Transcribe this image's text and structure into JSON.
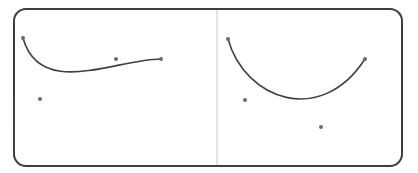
{
  "figure": {
    "width": 418,
    "height": 173,
    "background": "#ffffff",
    "frame": {
      "x": 14,
      "y": 9,
      "width": 388,
      "height": 157,
      "radius": 12,
      "stroke": "#3f3f3f",
      "stroke_width": 2
    },
    "divider": {
      "x": 217,
      "y1": 10,
      "y2": 165,
      "stroke": "#c8c8c8",
      "stroke_width": 1
    },
    "curve_color": "#404040",
    "point_color": "#6a6a6a",
    "panels": [
      {
        "name": "left-panel",
        "curve": {
          "type": "cubic-bezier",
          "start": [
            23,
            38
          ],
          "control1": [
            40,
            99
          ],
          "control2": [
            116,
            59
          ],
          "end": [
            161,
            59
          ]
        },
        "points": [
          {
            "name": "start-point",
            "x": 23,
            "y": 38
          },
          {
            "name": "end-point",
            "x": 161,
            "y": 59
          },
          {
            "name": "control-point-1",
            "x": 40,
            "y": 99
          },
          {
            "name": "control-point-2",
            "x": 116,
            "y": 59
          }
        ]
      },
      {
        "name": "right-panel",
        "curve": {
          "type": "cubic-bezier",
          "start": [
            228,
            39
          ],
          "control1": [
            245,
            100
          ],
          "control2": [
            321,
            127
          ],
          "end": [
            365,
            59
          ]
        },
        "points": [
          {
            "name": "start-point",
            "x": 228,
            "y": 39
          },
          {
            "name": "end-point",
            "x": 365,
            "y": 59
          },
          {
            "name": "control-point-1",
            "x": 245,
            "y": 100
          },
          {
            "name": "control-point-2",
            "x": 321,
            "y": 127
          }
        ]
      }
    ]
  }
}
